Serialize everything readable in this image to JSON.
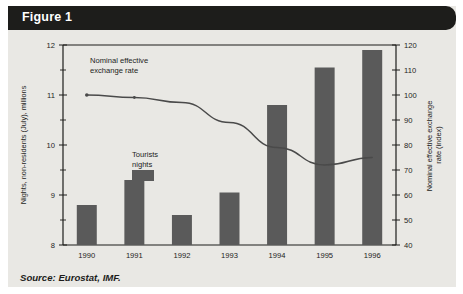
{
  "figure": {
    "header_label": "Figure 1",
    "source_note": "Source: Eurostat, IMF."
  },
  "colors": {
    "panel_background": "#e9e8e4",
    "header_background": "#1d1d1b",
    "header_text": "#ffffff",
    "bar_fill": "#5a5a5a",
    "line_stroke": "#4a4a4a",
    "axis_stroke": "#1d1d1b",
    "text": "#1d1d1b"
  },
  "chart_data": {
    "type": "bar",
    "title": "Figure 1",
    "subtitle": "",
    "xlabel": "",
    "categories": [
      "1990",
      "1991",
      "1992",
      "1993",
      "1994",
      "1995",
      "1996"
    ],
    "grid": false,
    "legend": "inline-annotations",
    "series": [
      {
        "name": "Tourists nights",
        "type": "bar",
        "axis": "left",
        "ylabel": "Nights, non-residents (July), millions",
        "values": [
          8.8,
          9.3,
          8.6,
          9.05,
          10.8,
          11.55,
          11.9
        ],
        "ylim": [
          8,
          12
        ],
        "ytick_values": [
          8,
          9,
          10,
          11,
          12
        ],
        "ytick_labels": [
          "8",
          "9",
          "10",
          "11",
          "12"
        ],
        "yminor_step": 0.5
      },
      {
        "name": "Nominal effective exchange rate",
        "type": "line",
        "axis": "right",
        "ylabel": "Nominal effective exchange rate (index)",
        "values": [
          100,
          99,
          97,
          89,
          79,
          72,
          75
        ],
        "ylim": [
          40,
          120
        ],
        "ytick_values": [
          40,
          50,
          60,
          70,
          80,
          90,
          100,
          110,
          120
        ],
        "ytick_labels": [
          "40",
          "50",
          "60",
          "70",
          "80",
          "90",
          "100",
          "110",
          "120"
        ]
      }
    ],
    "annotations": [
      {
        "text_line1": "Nominal effective",
        "text_line2": "exchange rate"
      },
      {
        "text_line1": "Tourists",
        "text_line2": "nights"
      }
    ]
  }
}
